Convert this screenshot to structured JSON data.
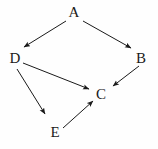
{
  "diagram": {
    "background_color": "#fefefe",
    "stroke_color": "#1a1a1a",
    "label_color": "#1a1a1a",
    "width": 158,
    "height": 149
  },
  "nodes": [
    {
      "id": "A",
      "label": "A",
      "x": 74,
      "y": 13
    },
    {
      "id": "D",
      "label": "D",
      "x": 15,
      "y": 59
    },
    {
      "id": "B",
      "label": "B",
      "x": 141,
      "y": 59
    },
    {
      "id": "C",
      "label": "C",
      "x": 101,
      "y": 95
    },
    {
      "id": "E",
      "label": "E",
      "x": 55,
      "y": 133
    }
  ],
  "edges": [
    {
      "id": "A-D",
      "from": "A",
      "to": "D",
      "x1": 66,
      "y1": 21,
      "x2": 24,
      "y2": 47
    },
    {
      "id": "A-B",
      "from": "A",
      "to": "B",
      "x1": 83,
      "y1": 21,
      "x2": 131,
      "y2": 48
    },
    {
      "id": "D-C",
      "from": "D",
      "to": "C",
      "x1": 23,
      "y1": 63,
      "x2": 89,
      "y2": 89
    },
    {
      "id": "D-E",
      "from": "D",
      "to": "E",
      "x1": 17,
      "y1": 69,
      "x2": 45,
      "y2": 114
    },
    {
      "id": "B-C",
      "from": "B",
      "to": "C",
      "x1": 139,
      "y1": 66,
      "x2": 113,
      "y2": 86
    },
    {
      "id": "E-C",
      "from": "E",
      "to": "C",
      "x1": 63,
      "y1": 128,
      "x2": 93,
      "y2": 101
    }
  ]
}
